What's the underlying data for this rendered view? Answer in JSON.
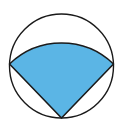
{
  "diagram": {
    "colors": {
      "background": "#ffffff",
      "stroke": "#1a1a1a",
      "sector_fill": "#5bb5e5"
    },
    "circle": {
      "cx": 61.5,
      "cy": 66,
      "r": 52
    },
    "sector": {
      "apex": {
        "x": 61.5,
        "y": 118
      },
      "left": {
        "x": 9.5,
        "y": 64
      },
      "right": {
        "x": 113.5,
        "y": 64
      },
      "radius": 75
    }
  }
}
